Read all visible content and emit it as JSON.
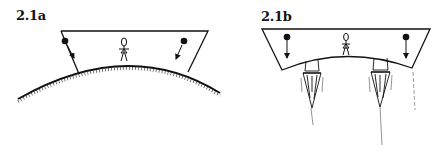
{
  "figures": [
    {
      "id": "2.1a",
      "label": "2.1a",
      "description": "Trapezoidal room resting on a curved planet surface; person standing at center; two balls with arrows pointing inward toward planet center",
      "elements": [
        "room-trapezoid",
        "planet-surface-arc",
        "person",
        "ball-left",
        "ball-right",
        "arrow-left",
        "arrow-right"
      ]
    },
    {
      "id": "2.1b",
      "label": "2.1b",
      "description": "Trapezoidal room with curved floor propelled by two rocket engines; person standing at center; two balls with arrows pointing straight down",
      "elements": [
        "room-trapezoid",
        "curved-floor",
        "person",
        "ball-left",
        "ball-right",
        "arrow-left",
        "arrow-right",
        "rocket-engine-left",
        "rocket-engine-right",
        "exhaust-flames"
      ]
    }
  ],
  "colors": {
    "ink": "#111111",
    "background": "#ffffff"
  }
}
